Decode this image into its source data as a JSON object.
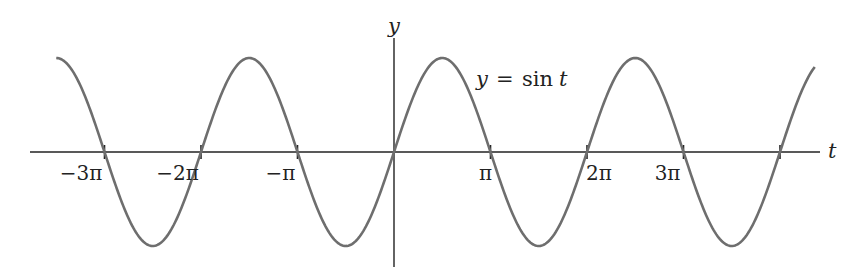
{
  "chart_data": {
    "type": "line",
    "title": "",
    "xlabel": "t",
    "ylabel": "y",
    "curve_label": "y = sin t",
    "function": "sin",
    "x_range": [
      -11.0,
      13.0
    ],
    "y_range": [
      -1,
      1
    ],
    "ticks": [
      {
        "value": -9.4248,
        "label": "−3π"
      },
      {
        "value": -6.2832,
        "label": "−2π"
      },
      {
        "value": -3.1416,
        "label": "−π"
      },
      {
        "value": 3.1416,
        "label": "π"
      },
      {
        "value": 6.2832,
        "label": "2π"
      },
      {
        "value": 9.4248,
        "label": "3π"
      },
      {
        "value": 12.5664,
        "label": ""
      }
    ],
    "grid": false,
    "legend": "none",
    "colors": {
      "curve": "#6e6e6e",
      "axes": "#222222"
    }
  },
  "axes": {
    "x_label": "t",
    "y_label": "y"
  },
  "curve_label": {
    "lhs": "y",
    "eq": "=",
    "fn": "sin",
    "var": "t"
  }
}
